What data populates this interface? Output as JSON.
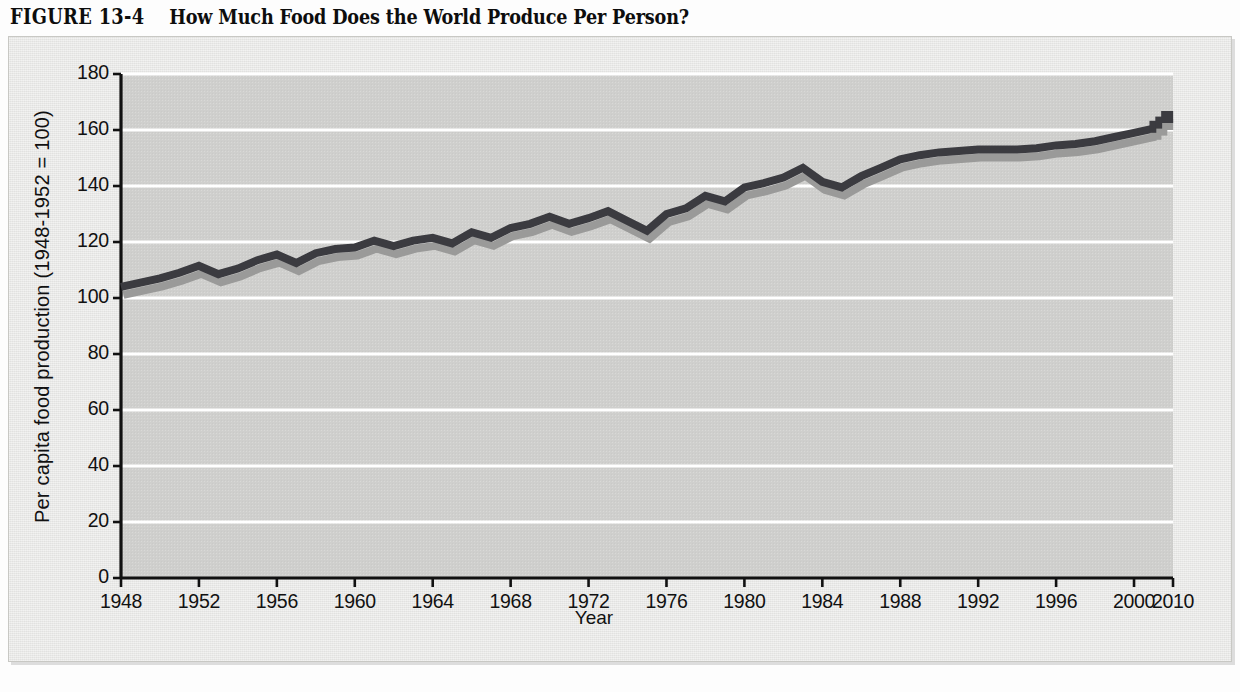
{
  "figure": {
    "number_label": "FIGURE 13-4",
    "caption": "How Much Food Does the World Produce Per Person?"
  },
  "colors": {
    "page_background": "#fdfdfd",
    "panel_background": "#e8e8e6",
    "plot_background": "#cfcfcd",
    "gridline": "#ffffff",
    "axis": "#111111",
    "line": "#3b3b40",
    "line_shadow": "#9a9a99",
    "text": "#111111",
    "title": "#0d0d0d"
  },
  "chart_data": {
    "type": "line",
    "title": "How Much Food Does the World Produce Per Person?",
    "xlabel": "Year",
    "ylabel": "Per capita food production (1948-1952 = 100)",
    "ylim": [
      0,
      180
    ],
    "ytick_values": [
      0,
      20,
      40,
      60,
      80,
      100,
      120,
      140,
      160,
      180
    ],
    "ytick_labels": [
      "0",
      "20",
      "40",
      "60",
      "80",
      "100",
      "120",
      "140",
      "160",
      "180"
    ],
    "xlim": [
      1948,
      2002
    ],
    "xtick_labels": [
      "1948",
      "1952",
      "1956",
      "1960",
      "1964",
      "1968",
      "1972",
      "1976",
      "1980",
      "1984",
      "1988",
      "1992",
      "1996",
      "2000",
      "2010"
    ],
    "xtick_values": [
      1948,
      1952,
      1956,
      1960,
      1964,
      1968,
      1972,
      1976,
      1980,
      1984,
      1988,
      1992,
      1996,
      2000,
      2002
    ],
    "axis_break_after": 2000,
    "grid": "horizontal",
    "legend": "none",
    "series": [
      {
        "name": "Per capita food production index",
        "style": "solid-with-drop-shadow",
        "x": [
          1948,
          1949,
          1950,
          1951,
          1952,
          1953,
          1954,
          1955,
          1956,
          1957,
          1958,
          1959,
          1960,
          1961,
          1962,
          1963,
          1964,
          1965,
          1966,
          1967,
          1968,
          1969,
          1970,
          1971,
          1972,
          1973,
          1974,
          1975,
          1976,
          1977,
          1978,
          1979,
          1980,
          1981,
          1982,
          1983,
          1984,
          1985,
          1986,
          1987,
          1988,
          1989,
          1990,
          1991,
          1992,
          1993,
          1994,
          1995,
          1996,
          1997,
          1998,
          1999,
          2000,
          2001
        ],
        "values": [
          104,
          105.5,
          107,
          109,
          111.5,
          108.5,
          110.5,
          113.5,
          115.5,
          112.5,
          116,
          117.5,
          118,
          120.5,
          118.5,
          120.5,
          121.5,
          119.5,
          123.5,
          121.5,
          125,
          126.5,
          129,
          126.5,
          128.5,
          131,
          127.5,
          124,
          130,
          132,
          136.5,
          134.5,
          139.5,
          141,
          143,
          146.5,
          141.5,
          139.5,
          143.5,
          146.5,
          149.5,
          151,
          152,
          152.5,
          153,
          153,
          153,
          153.5,
          154.5,
          155,
          156,
          157.5,
          159,
          160.5
        ]
      },
      {
        "name": "Projection",
        "style": "dashed",
        "x": [
          2001.1,
          2001.4,
          2001.7
        ],
        "values": [
          161.5,
          163,
          165
        ]
      }
    ]
  },
  "annotations": {
    "projection_note": "dashed segment extends to 2010"
  }
}
